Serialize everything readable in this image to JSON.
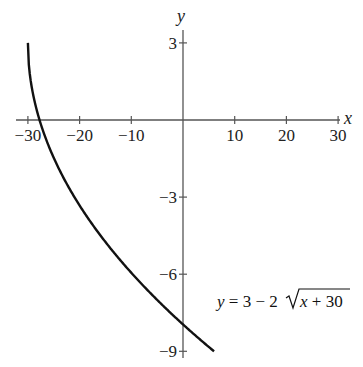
{
  "chart_data": {
    "type": "line",
    "title": "",
    "xlabel": "x",
    "ylabel": "y",
    "xlim": [
      -31,
      31
    ],
    "ylim": [
      -9.5,
      4
    ],
    "grid": false,
    "x_ticks": [
      -30,
      -20,
      -10,
      10,
      20,
      30
    ],
    "x_tick_labels": [
      "−30",
      "−20",
      "−10",
      "10",
      "20",
      "30"
    ],
    "y_ticks": [
      3,
      -3,
      -6,
      -9
    ],
    "y_tick_labels": [
      "3",
      "−3",
      "−6",
      "−9"
    ],
    "series": [
      {
        "name": "y = 3 − 2√(x + 30)",
        "function": "3 - 2*sqrt(x+30)",
        "domain": [
          -30,
          6
        ],
        "x": [
          -30,
          -29.5,
          -29,
          -28,
          -27,
          -25,
          -22,
          -20,
          -15,
          -10,
          -5,
          0,
          6
        ],
        "values": [
          3,
          1.59,
          1,
          0,
          -0.46,
          -1.47,
          -2.66,
          -3.32,
          -4.75,
          -5.94,
          -6.83,
          -7.95,
          -9
        ]
      }
    ],
    "annotations": [
      {
        "text": "y = 3 − 2√x + 30",
        "position": "lower-right"
      }
    ]
  },
  "labels": {
    "x_axis": "x",
    "y_axis": "y",
    "equation_y": "y",
    "equation_rest": " = 3 − 2",
    "equation_radicand_x": "x",
    "equation_radicand_rest": " + 30"
  }
}
